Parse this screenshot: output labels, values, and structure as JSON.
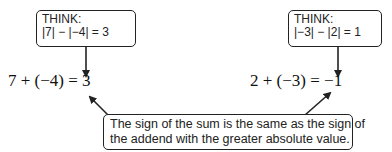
{
  "left_example": {
    "think_label": "THINK:",
    "think_expr": "|7| − |−4| = 3",
    "equation": "7 + (−4) = 3"
  },
  "right_example": {
    "think_label": "THINK:",
    "think_expr": "|−3| − |2| = 1",
    "equation": "2 + (−3) = −1"
  },
  "rule": {
    "line1": "The sign of the sum is the same as the sign of",
    "line2": "the addend with the greater absolute value."
  },
  "colors": {
    "stroke": "#222222",
    "background": "#ffffff"
  }
}
